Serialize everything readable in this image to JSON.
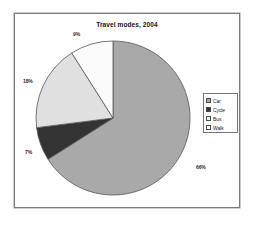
{
  "page": {
    "background_color": "#ffffff",
    "frame_border_color": "#7c7c7c"
  },
  "chart_data": {
    "type": "pie",
    "title": "Travel modes, 2004",
    "xlabel": "",
    "ylabel": "",
    "categories": [
      "Car",
      "Cycle",
      "Bus",
      "Walk"
    ],
    "values": [
      66,
      7,
      18,
      9
    ],
    "value_labels": [
      "66%",
      "7%",
      "18%",
      "9%"
    ],
    "unit": "%",
    "total": 100,
    "start_angle_deg": 0,
    "direction": "clockwise",
    "slice_colors": [
      "#a9a9a9",
      "#333333",
      "#e0e0e0",
      "#fbfbfb"
    ],
    "slice_border_color": "#555555",
    "legend_position": "right",
    "grid": false,
    "slices": [
      {
        "name": "Car",
        "value": 66,
        "label": "66%",
        "color": "#a9a9a9"
      },
      {
        "name": "Cycle",
        "value": 7,
        "label": "7%",
        "color": "#333333"
      },
      {
        "name": "Bus",
        "value": 18,
        "label": "18%",
        "color": "#e0e0e0"
      },
      {
        "name": "Walk",
        "value": 9,
        "label": "9%",
        "color": "#fbfbfb"
      }
    ]
  },
  "legend": {
    "items": [
      {
        "label": "Car",
        "swatch_color": "#a9a9a9"
      },
      {
        "label": "Cycle",
        "swatch_color": "#333333"
      },
      {
        "label": "Bus",
        "swatch_color": "#f2f2f2"
      },
      {
        "label": "Walk",
        "swatch_color": "#ffffff"
      }
    ]
  }
}
